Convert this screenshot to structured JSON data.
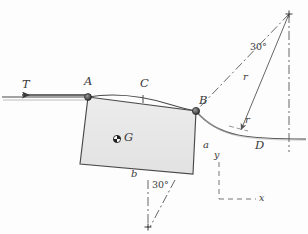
{
  "figure": {
    "background_color": "#fdfdfd",
    "block_fill": "#e8e8e8",
    "line_color": "#3a3a3a"
  },
  "labels": {
    "tension": "T",
    "point_a": "A",
    "point_b": "B",
    "point_c": "C",
    "point_d": "D",
    "center_of_gravity": "G",
    "dim_a": "a",
    "dim_b": "b",
    "radius_left": "r",
    "radius_right": "r",
    "angle_top": "30°",
    "angle_bottom": "30°",
    "axis_x": "x",
    "axis_y": "y"
  },
  "geometry": {
    "block_vertices": "88,97 196,111 193,174 80,164",
    "terrain_left_y": 97,
    "apex": {
      "x": 289,
      "y": 14
    },
    "angle_value_deg": 30
  }
}
